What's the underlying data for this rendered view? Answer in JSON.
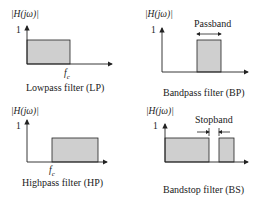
{
  "colors": {
    "fill": "#cfcfcf",
    "stroke": "#222222"
  },
  "panels": [
    {
      "id": "lp",
      "ylabel": "|H(jω)|",
      "one": "1",
      "fc": "fc",
      "caption": "Lowpass filter (LP)"
    },
    {
      "id": "bp",
      "ylabel": "|H(jω)|",
      "one": "1",
      "band": "Passband",
      "caption": "Bandpass filter (BP)"
    },
    {
      "id": "hp",
      "ylabel": "|H(jω)|",
      "one": "1",
      "fc": "fc",
      "caption": "Highpass filter (HP)"
    },
    {
      "id": "bs",
      "ylabel": "|H(jω)|",
      "one": "1",
      "band": "Stopband",
      "caption": "Bandstop filter (BS)"
    }
  ]
}
